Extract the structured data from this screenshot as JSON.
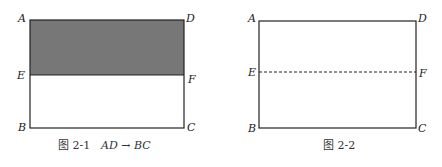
{
  "figures": [
    {
      "id": "fig-2-1",
      "caption_prefix": "图 2-1",
      "caption_math": "AD → BC",
      "shaded_region": "AEFD",
      "shade_color": "#777777",
      "line_EF_style": "solid",
      "labels": {
        "A": "A",
        "D": "D",
        "E": "E",
        "F": "F",
        "B": "B",
        "C": "C"
      }
    },
    {
      "id": "fig-2-2",
      "caption_prefix": "图 2-2",
      "caption_math": "",
      "shaded_region": "",
      "line_EF_style": "dashed",
      "labels": {
        "A": "A",
        "D": "D",
        "E": "E",
        "F": "F",
        "B": "B",
        "C": "C"
      }
    }
  ]
}
